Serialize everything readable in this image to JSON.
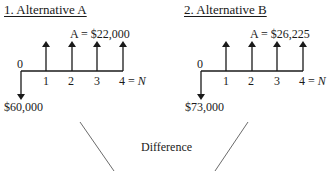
{
  "diagrams": [
    {
      "title": "1. Alternative A",
      "annuity_label": "A = $22,000",
      "initial_label": "$60,000",
      "period_labels": [
        "0",
        "1",
        "2",
        "3",
        "4 = "
      ],
      "n_label": "N"
    },
    {
      "title": "2. Alternative B",
      "annuity_label": "A = $26,225",
      "initial_label": "$73,000",
      "period_labels": [
        "0",
        "1",
        "2",
        "3",
        "4 = "
      ],
      "n_label": "N"
    }
  ],
  "difference_label": "Difference",
  "colors": {
    "ink": "#1a1a1a",
    "line": "#6b6b6b"
  }
}
